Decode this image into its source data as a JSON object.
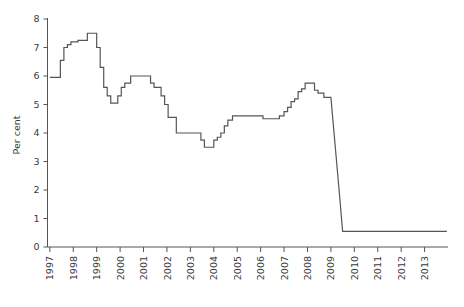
{
  "chart_data": {
    "type": "line",
    "title": "",
    "subtitle": "",
    "xlabel": "",
    "ylabel": "Per cent",
    "grid": false,
    "legend": null,
    "legend_position": "none",
    "line_color": "#555555",
    "axis_color": "#555555",
    "background_color": "#ffffff",
    "xlim": [
      1996.9,
      2014.0
    ],
    "ylim": [
      0,
      8
    ],
    "xticks": [
      "1997",
      "1998",
      "1999",
      "2000",
      "2001",
      "2002",
      "2003",
      "2004",
      "2005",
      "2006",
      "2007",
      "2008",
      "2009",
      "2010",
      "2011",
      "2012",
      "2013"
    ],
    "xtick_values": [
      1997,
      1998,
      1999,
      2000,
      2001,
      2002,
      2003,
      2004,
      2005,
      2006,
      2007,
      2008,
      2009,
      2010,
      2011,
      2012,
      2013
    ],
    "yticks": [
      "0",
      "1",
      "2",
      "3",
      "4",
      "5",
      "6",
      "7",
      "8"
    ],
    "ytick_values": [
      0,
      1,
      2,
      3,
      4,
      5,
      6,
      7,
      8
    ],
    "series": [
      {
        "name": "Official interest rate",
        "color": "#555555",
        "x": [
          1997.0,
          1997.3,
          1997.45,
          1997.6,
          1997.75,
          1997.9,
          1998.05,
          1998.2,
          1998.45,
          1998.6,
          1998.75,
          1998.9,
          1999.0,
          1999.15,
          1999.3,
          1999.45,
          1999.6,
          1999.75,
          1999.9,
          2000.05,
          2000.2,
          2000.45,
          2000.7,
          2001.0,
          2001.15,
          2001.3,
          2001.45,
          2001.6,
          2001.75,
          2001.9,
          2002.05,
          2002.4,
          2002.9,
          2003.1,
          2003.3,
          2003.45,
          2003.6,
          2003.8,
          2004.0,
          2004.15,
          2004.3,
          2004.45,
          2004.6,
          2004.8,
          2005.5,
          2005.9,
          2006.1,
          2006.5,
          2006.8,
          2007.0,
          2007.15,
          2007.3,
          2007.45,
          2007.6,
          2007.75,
          2007.9,
          2008.1,
          2008.3,
          2008.45,
          2008.7,
          2008.95,
          2009.0,
          2009.35,
          2009.5,
          2013.95
        ],
        "y": [
          5.95,
          5.95,
          6.55,
          7.0,
          7.1,
          7.2,
          7.2,
          7.25,
          7.25,
          7.5,
          7.5,
          7.5,
          7.0,
          6.3,
          5.6,
          5.3,
          5.05,
          5.05,
          5.3,
          5.6,
          5.75,
          6.0,
          6.0,
          6.0,
          6.0,
          5.75,
          5.6,
          5.6,
          5.3,
          5.0,
          4.55,
          4.0,
          4.0,
          4.0,
          4.0,
          3.75,
          3.5,
          3.5,
          3.75,
          3.85,
          4.0,
          4.25,
          4.45,
          4.6,
          4.6,
          4.6,
          4.5,
          4.5,
          4.6,
          4.75,
          4.9,
          5.1,
          5.2,
          5.45,
          5.55,
          5.75,
          5.75,
          5.5,
          5.4,
          5.25,
          5.25,
          5.25,
          2.0,
          0.55,
          0.55
        ]
      }
    ],
    "annotations": []
  },
  "axis": {
    "y_title": "Per cent"
  }
}
